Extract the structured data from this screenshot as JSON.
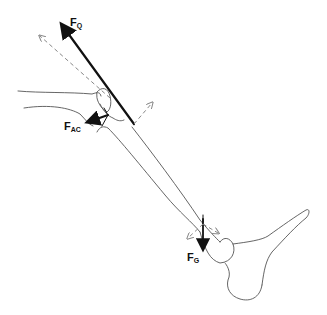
{
  "diagram": {
    "colors": {
      "ink": "#111111",
      "outline": "#555555",
      "component": "#888888"
    },
    "forces": [
      {
        "id": "quadriceps",
        "label_main": "F",
        "label_sub": "Q",
        "style": "solid"
      },
      {
        "id": "articular-contact",
        "label_main": "F",
        "label_sub": "AC",
        "style": "solid"
      },
      {
        "id": "gravity",
        "label_main": "F",
        "label_sub": "G",
        "style": "solid"
      }
    ],
    "components": [
      {
        "id": "quadriceps-component",
        "style": "dashed"
      },
      {
        "id": "patellar-component",
        "style": "dashed"
      },
      {
        "id": "gravity-component-a",
        "style": "dashed"
      },
      {
        "id": "gravity-component-b",
        "style": "dashed"
      }
    ]
  }
}
